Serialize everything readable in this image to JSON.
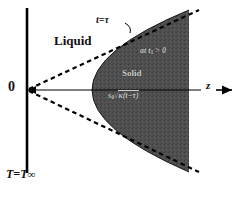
{
  "figure": {
    "kind": "solidification-front-diagram",
    "background_color": "#ffffff",
    "shade_color": "#4a4a4a",
    "line_color": "#000000"
  },
  "labels": {
    "liquid": "Liquid",
    "solid": "Solid",
    "time_front": "t=τ",
    "origin": "0",
    "axis_z": "z",
    "boundary_temp_T": "T",
    "boundary_temp_eq": "=",
    "boundary_temp_Tinf": "T",
    "boundary_temp_infinity": "∞",
    "region_time": "at t",
    "region_time_sub": "1",
    "region_time_rel": " > 0",
    "front_formula_prefix": "s",
    "front_formula_sub": "0",
    "front_formula_radical": "√",
    "front_formula_body": "κ(t−τ)"
  },
  "geometry": {
    "vertical_boundary_x": 27,
    "vertical_boundary_y_top": 8,
    "vertical_boundary_y_bottom": 173,
    "origin_x": 28,
    "origin_y": 90,
    "axis_end_x": 200,
    "axis_arrow_tip_x": 233,
    "parabola_vertex_x": 92,
    "parabola_vertex_y": 90,
    "shade_right_edge_x": 189,
    "asymptote_upper_end": [
      199,
      10
    ],
    "asymptote_lower_end": [
      199,
      172
    ]
  }
}
